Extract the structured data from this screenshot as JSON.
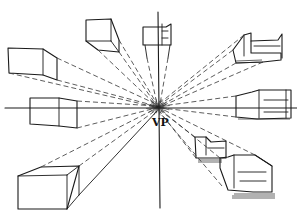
{
  "diagram": {
    "vanishing_point_label": "VP",
    "ink_color": "#1a1a1a",
    "background_color": "#ffffff",
    "objects": [
      {
        "id": "box-top-center",
        "kind": "box",
        "description": "cube above horizon, top center-left"
      },
      {
        "id": "box-upper-left",
        "kind": "box",
        "description": "cube above horizon, left"
      },
      {
        "id": "chair-top-center",
        "kind": "chair",
        "description": "armchair on vertical line, top"
      },
      {
        "id": "sofa-upper-right",
        "kind": "sofa",
        "description": "sofa above horizon, right"
      },
      {
        "id": "box-horizon-left",
        "kind": "box",
        "description": "box crossing horizon, left"
      },
      {
        "id": "sofa-horizon-right",
        "kind": "sofa",
        "description": "sofa crossing horizon, right"
      },
      {
        "id": "box-lower-left",
        "kind": "box",
        "description": "long box below horizon, lower left"
      },
      {
        "id": "chair-lower-right-back",
        "kind": "chair",
        "description": "armchair below horizon, back"
      },
      {
        "id": "chair-lower-right-front",
        "kind": "chair",
        "description": "armchair below horizon, front"
      }
    ]
  }
}
